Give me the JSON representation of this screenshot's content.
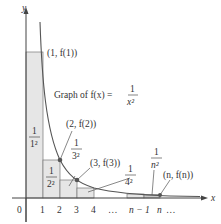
{
  "figure": {
    "function_label": "Graph of f(x) =",
    "function_numerator": "1",
    "function_denominator": "x²",
    "axes": {
      "x_label": "x",
      "y_label": "y"
    },
    "x_ticks": [
      "0",
      "1",
      "2",
      "3",
      "4",
      "…",
      "n − 1",
      "n",
      "…"
    ],
    "points": [
      {
        "label": "(1, f(1))"
      },
      {
        "label": "(2, f(2))"
      },
      {
        "label": "(3, f(3))"
      },
      {
        "label": "(n, f(n))"
      }
    ],
    "rect_labels": [
      {
        "num": "1",
        "den": "1²"
      },
      {
        "num": "1",
        "den": "2²"
      },
      {
        "num": "1",
        "den": "3²"
      },
      {
        "num": "1",
        "den": "4²"
      },
      {
        "num": "1",
        "den": "n²"
      }
    ],
    "colors": {
      "fill": "#e4e4e4",
      "curve": "#555555",
      "axis": "#444444",
      "point": "#555555"
    }
  }
}
